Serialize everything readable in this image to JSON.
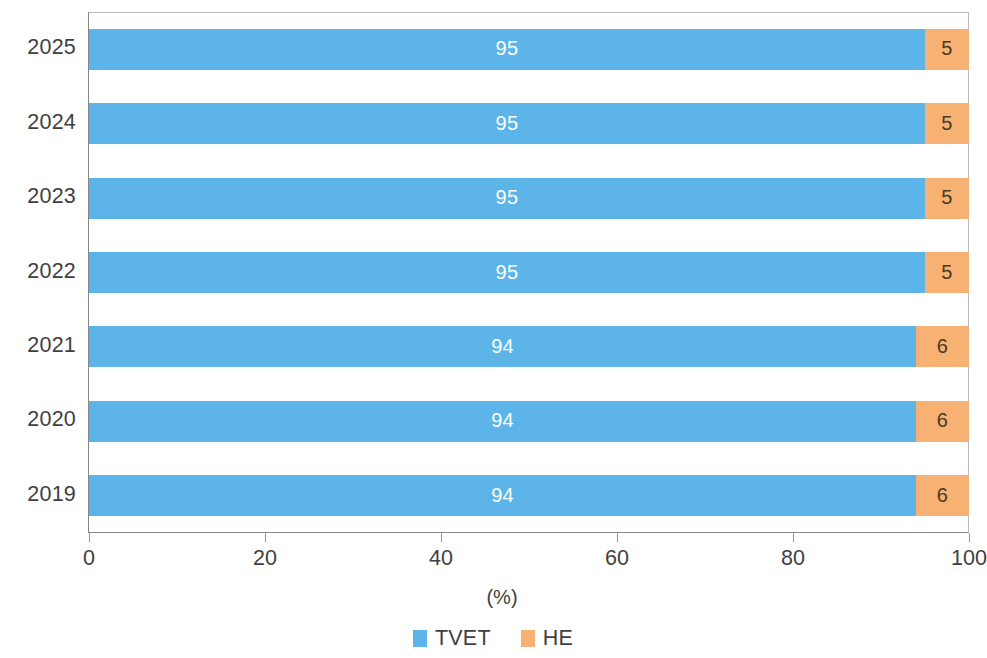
{
  "chart_data": {
    "type": "bar",
    "orientation": "horizontal",
    "stacked": true,
    "stacked_normalized": true,
    "title": "",
    "subtitle": "",
    "xlabel": "(%)",
    "ylabel": "",
    "xlim": [
      0,
      100
    ],
    "ylim": null,
    "grid": false,
    "legend_position": "bottom-center",
    "categories": [
      "2025",
      "2024",
      "2023",
      "2022",
      "2021",
      "2020",
      "2019"
    ],
    "xticks": [
      0,
      20,
      40,
      60,
      80,
      100
    ],
    "xtick_labels": [
      "0",
      "20",
      "40",
      "60",
      "80",
      "100"
    ],
    "series": [
      {
        "name": "TVET",
        "color": "#5CB4E8",
        "label_color": "#FFFFFF",
        "values": [
          95,
          95,
          95,
          95,
          94,
          94,
          94
        ],
        "value_labels": [
          "95",
          "95",
          "95",
          "95",
          "94",
          "94",
          "94"
        ]
      },
      {
        "name": "HE",
        "color": "#F6B173",
        "label_color": "#4A3A22",
        "values": [
          5,
          5,
          5,
          5,
          6,
          6,
          6
        ],
        "value_labels": [
          "5",
          "5",
          "5",
          "5",
          "6",
          "6",
          "6"
        ]
      }
    ],
    "legend": [
      {
        "label": "TVET",
        "color": "#5CB4E8"
      },
      {
        "label": "HE",
        "color": "#F6B173"
      }
    ]
  }
}
